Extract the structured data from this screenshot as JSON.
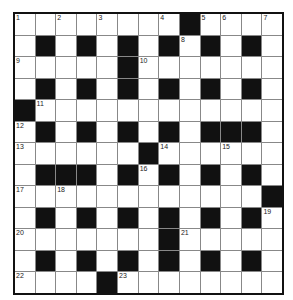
{
  "puzzle": {
    "rows": 13,
    "cols": 13,
    "colors": {
      "black": "#111111",
      "white": "#ffffff",
      "border": "#111111",
      "gridline": "#888888"
    },
    "layout": [
      "........#....",
      ".#.#.#.#.#.#.",
      ".....#.......",
      ".#.#.#.#.#.#.",
      "#............",
      ".#.#.#.#.###.",
      "......#......",
      ".###.#.#.#.#.",
      "............#",
      ".#.#.#.#.#.#.",
      ".......#.....",
      ".#.#.#.#.#.#.",
      "....#........"
    ],
    "numbers": [
      {
        "r": 0,
        "c": 0,
        "n": "1"
      },
      {
        "r": 0,
        "c": 2,
        "n": "2"
      },
      {
        "r": 0,
        "c": 4,
        "n": "3"
      },
      {
        "r": 0,
        "c": 7,
        "n": "4"
      },
      {
        "r": 0,
        "c": 9,
        "n": "5"
      },
      {
        "r": 0,
        "c": 10,
        "n": "6"
      },
      {
        "r": 0,
        "c": 12,
        "n": "7"
      },
      {
        "r": 1,
        "c": 8,
        "n": "8"
      },
      {
        "r": 2,
        "c": 0,
        "n": "9"
      },
      {
        "r": 2,
        "c": 6,
        "n": "10"
      },
      {
        "r": 4,
        "c": 1,
        "n": "11"
      },
      {
        "r": 5,
        "c": 0,
        "n": "12"
      },
      {
        "r": 6,
        "c": 0,
        "n": "13"
      },
      {
        "r": 6,
        "c": 7,
        "n": "14"
      },
      {
        "r": 6,
        "c": 10,
        "n": "15"
      },
      {
        "r": 7,
        "c": 6,
        "n": "16"
      },
      {
        "r": 8,
        "c": 0,
        "n": "17"
      },
      {
        "r": 8,
        "c": 2,
        "n": "18"
      },
      {
        "r": 9,
        "c": 12,
        "n": "19"
      },
      {
        "r": 10,
        "c": 0,
        "n": "20"
      },
      {
        "r": 10,
        "c": 8,
        "n": "21"
      },
      {
        "r": 12,
        "c": 0,
        "n": "22"
      },
      {
        "r": 12,
        "c": 5,
        "n": "23"
      }
    ]
  }
}
